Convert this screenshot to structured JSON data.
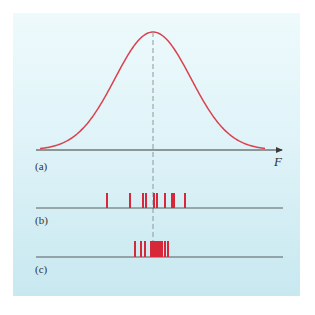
{
  "figure": {
    "axis_label": "F",
    "labels": {
      "a": "(a)",
      "b": "(b)",
      "c": "(c)"
    },
    "colors": {
      "curve": "#d9434e",
      "tick": "#d62839",
      "axis": "#3a3a3a",
      "dashed": "#8a9a9f",
      "panel_top": "#eefafc",
      "panel_bottom": "#c8e8f0"
    },
    "curve": {
      "type": "gaussian",
      "center_x": 153,
      "peak_y": 32,
      "baseline_y": 150,
      "sigma_px": 38,
      "x_start": 40,
      "x_end": 265
    },
    "row_b_ticks_x": [
      107,
      130,
      143,
      146,
      154,
      157,
      165,
      172,
      174,
      185
    ],
    "row_c_ticks_x": [
      135,
      141,
      145,
      151,
      152,
      154,
      156,
      158,
      160,
      162,
      165,
      168
    ]
  }
}
